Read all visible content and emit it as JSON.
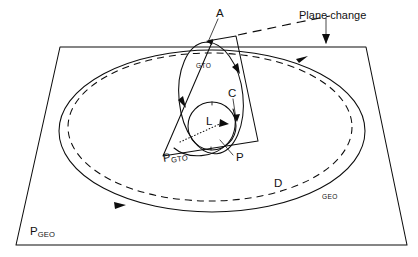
{
  "figure": {
    "type": "orbital-transfer-diagram"
  },
  "labels": {
    "apogee": "A",
    "gto_orbit": "GTO",
    "gto_plane": "P",
    "gto_plane_sub": "GTO",
    "geo_plane": "P",
    "geo_plane_sub": "GEO",
    "geo_orbit": "GEO",
    "drift_orbit": "D",
    "circularization": "C",
    "perigee": "P",
    "earth": "L",
    "plane_change": "Plane change"
  },
  "colors": {
    "line": "#0d0d0d",
    "background": "#ffffff",
    "label_text": "#121212"
  },
  "geometry": {
    "geo_plane_corners": [
      [
        60,
        47
      ],
      [
        366,
        47
      ],
      [
        407,
        245
      ],
      [
        16,
        245
      ]
    ],
    "gto_plane_corners": [
      [
        213,
        40
      ],
      [
        236,
        36
      ],
      [
        258,
        141
      ],
      [
        163,
        156
      ]
    ],
    "earth_circle": {
      "cx": 212,
      "cy": 126,
      "r": 24
    },
    "geo_ellipse": {
      "cx": 212,
      "cy": 131,
      "rx": 153,
      "ry": 81
    },
    "drift_ellipse": {
      "cx": 210,
      "cy": 127,
      "rx": 142,
      "ry": 74
    },
    "gto_ellipse": {
      "cx": 211,
      "cy": 98,
      "rx": 32,
      "ry": 56,
      "rotation": -6
    }
  }
}
